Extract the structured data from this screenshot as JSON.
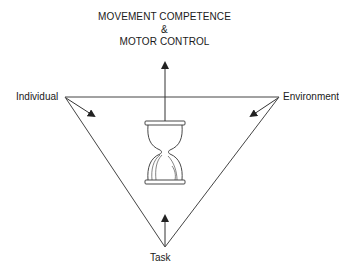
{
  "title": {
    "line1": "MOVEMENT COMPETENCE",
    "line2": "&",
    "line3": "MOTOR CONTROL"
  },
  "nodes": {
    "individual": "Individual",
    "environment": "Environment",
    "task": "Task"
  },
  "center_icon": "hourglass-icon",
  "colors": {
    "stroke": "#333333",
    "background": "#ffffff"
  }
}
